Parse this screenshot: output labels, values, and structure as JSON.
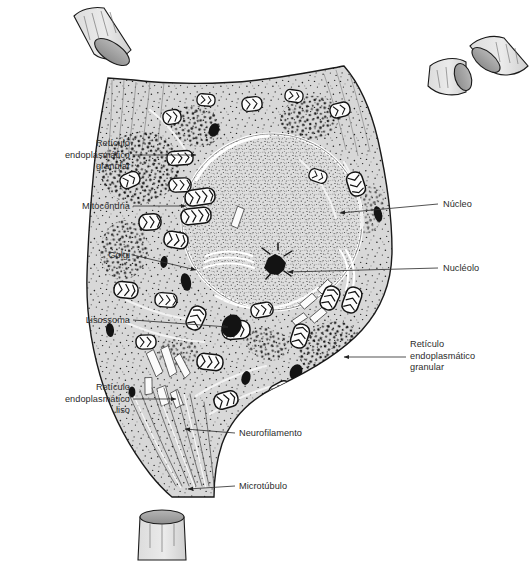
{
  "figure": {
    "type": "biological-diagram",
    "language": "pt-BR",
    "background_color": "#ffffff",
    "cytoplasm_color": "#d8d8d8",
    "nucleus_color": "#dcdcdc",
    "outline_color": "#1a1a1a",
    "stipple_color": "#1b1b1b",
    "label_color": "#2b2b2b",
    "leader_color": "#333333"
  },
  "labels": [
    {
      "id": "reticulo-endoplasmatico-granular-left",
      "text": "Retículo\nendoplasmático\ngranular",
      "align": "right",
      "x": 12,
      "y": 138,
      "w": 118,
      "leader": {
        "x1": 133,
        "y1": 155,
        "x2": 196,
        "y2": 155,
        "arrow": true
      }
    },
    {
      "id": "mitocondria",
      "text": "Mitocôndria",
      "align": "right",
      "x": 12,
      "y": 201,
      "w": 118,
      "leader": {
        "x1": 133,
        "y1": 206,
        "x2": 186,
        "y2": 206,
        "arrow": true
      }
    },
    {
      "id": "golgi",
      "text": "Golgi",
      "align": "right",
      "x": 12,
      "y": 250,
      "w": 118,
      "leader": {
        "x1": 133,
        "y1": 255,
        "x2": 196,
        "y2": 270,
        "arrow": true
      }
    },
    {
      "id": "lisossoma",
      "text": "Lisossoma",
      "align": "right",
      "x": 8,
      "y": 315,
      "w": 122,
      "leader": {
        "x1": 133,
        "y1": 320,
        "x2": 228,
        "y2": 327,
        "arrow": true
      }
    },
    {
      "id": "reticulo-endoplasmatico-liso",
      "text": "Retículo\nendoplasmático\nliso",
      "align": "right",
      "x": 12,
      "y": 382,
      "w": 118,
      "leader": {
        "x1": 133,
        "y1": 399,
        "x2": 176,
        "y2": 399,
        "arrow": true
      }
    },
    {
      "id": "nucleo",
      "text": "Núcleo",
      "align": "left",
      "x": 443,
      "y": 199,
      "w": 84,
      "leader": {
        "x1": 438,
        "y1": 204,
        "x2": 340,
        "y2": 213,
        "arrow": true
      }
    },
    {
      "id": "nucleolo",
      "text": "Nucléolo",
      "align": "left",
      "x": 443,
      "y": 263,
      "w": 84,
      "leader": {
        "x1": 438,
        "y1": 268,
        "x2": 288,
        "y2": 272,
        "arrow": true
      }
    },
    {
      "id": "reticulo-endoplasmatico-granular-right",
      "text": "Retículo\nendoplasmático\ngranular",
      "align": "left",
      "x": 410,
      "y": 339,
      "w": 118,
      "leader": {
        "x1": 406,
        "y1": 357,
        "x2": 344,
        "y2": 357,
        "arrow": true
      }
    },
    {
      "id": "neurofilamento",
      "text": "Neurofilamento",
      "align": "left",
      "x": 239,
      "y": 428,
      "w": 110,
      "leader": {
        "x1": 235,
        "y1": 433,
        "x2": 185,
        "y2": 429,
        "arrow": true
      }
    },
    {
      "id": "microtubulo",
      "text": "Microtúbulo",
      "align": "left",
      "x": 239,
      "y": 481,
      "w": 110,
      "leader": {
        "x1": 235,
        "y1": 486,
        "x2": 188,
        "y2": 489,
        "arrow": true
      }
    }
  ],
  "structures": [
    {
      "name": "soma",
      "description": "corpo celular do neurônio"
    },
    {
      "name": "dendrito-superior-esquerdo-seccionado",
      "description": "dendrito cortado, face elíptica"
    },
    {
      "name": "dendrito-superior-esquerdo-tronco",
      "description": "dendrito emergindo do soma"
    },
    {
      "name": "dendrito-superior-direito-seccionado-a",
      "description": "dendrito cortado"
    },
    {
      "name": "dendrito-superior-direito-seccionado-b",
      "description": "dendrito cortado"
    },
    {
      "name": "cone-de-implantacao",
      "description": "cone axônico na base"
    },
    {
      "name": "axonio-seccionado",
      "description": "segmento de axônio cortado"
    },
    {
      "name": "nucleo",
      "description": "núcleo grande e oval"
    },
    {
      "name": "nucleolo",
      "description": "nucléolo denso e escuro"
    },
    {
      "name": "mitocondrias",
      "description": "organelas ovais com cristas"
    },
    {
      "name": "lisossomas",
      "description": "corpos densos escuros"
    },
    {
      "name": "golgi",
      "description": "cisternas empilhadas"
    },
    {
      "name": "reticulo-endoplasmatico-granular",
      "description": "agregados de ribossomos (corpos de Nissl)"
    },
    {
      "name": "reticulo-endoplasmatico-liso",
      "description": "túbulos claros alongados"
    },
    {
      "name": "neurofilamentos",
      "description": "filamentos finos no cone axônico"
    },
    {
      "name": "microtubulos",
      "description": "túbulos longitudinais no axônio"
    }
  ]
}
